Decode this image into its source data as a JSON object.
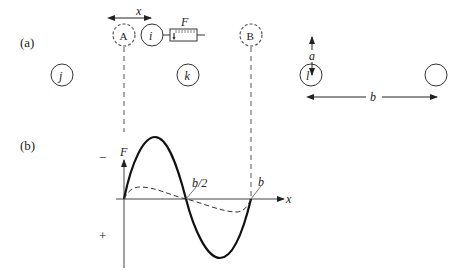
{
  "panel_a": {
    "label": "(a)",
    "circle_A": "A",
    "circle_i": "i",
    "force_label": "F",
    "displacement_label": "x",
    "circle_B": "B",
    "circle_j": "j",
    "circle_k": "k",
    "circle_l": "l",
    "radius_label": "a",
    "spacing_label": "b"
  },
  "panel_b": {
    "label": "(b)",
    "y_axis_label": "F",
    "x_axis_label": "x",
    "minus_sign": "−",
    "plus_sign": "+",
    "half_spacing_label": "b/2",
    "spacing_label": "b"
  },
  "colors": {
    "ink": "#222222",
    "dashed": "#555555",
    "background": "#ffffff"
  }
}
